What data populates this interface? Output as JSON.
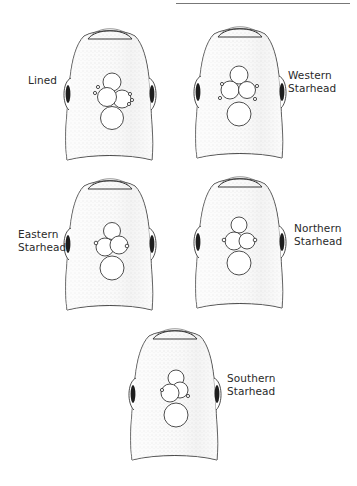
{
  "figure": {
    "type": "comparative illustration",
    "colors": {
      "outline": "#3a3a3a",
      "stipple": "#c9c9c9",
      "background": "#ffffff",
      "eye": "#1e1e1e"
    }
  },
  "heads": [
    {
      "id": "lined",
      "label_lines": [
        "Lined"
      ],
      "label_side": "left",
      "cx": 110,
      "top": 30
    },
    {
      "id": "western-starhead",
      "label_lines": [
        "Western",
        "Starhead"
      ],
      "label_side": "right",
      "cx": 240,
      "top": 28
    },
    {
      "id": "eastern-starhead",
      "label_lines": [
        "Eastern",
        "Starhead"
      ],
      "label_side": "left",
      "cx": 110,
      "top": 180
    },
    {
      "id": "northern-starhead",
      "label_lines": [
        "Northern",
        "Starhead"
      ],
      "label_side": "right",
      "cx": 240,
      "top": 178
    },
    {
      "id": "southern-starhead",
      "label_lines": [
        "Southern",
        "Starhead"
      ],
      "label_side": "right",
      "cx": 175,
      "top": 330
    }
  ],
  "labels": {
    "lined": {
      "l1": "Lined"
    },
    "western": {
      "l1": "Western",
      "l2": "Starhead"
    },
    "eastern": {
      "l1": "Eastern",
      "l2": "Starhead"
    },
    "northern": {
      "l1": "Northern",
      "l2": "Starhead"
    },
    "southern": {
      "l1": "Southern",
      "l2": "Starhead"
    }
  }
}
